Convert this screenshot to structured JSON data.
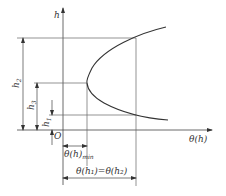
{
  "diagram": {
    "axes": {
      "y_label": "h",
      "x_label": "θ(h)",
      "origin_label": "O"
    },
    "dimensions": {
      "h2": {
        "base": "h",
        "sub": "2"
      },
      "h_min": {
        "base": "h",
        "sub": "3"
      },
      "h1": {
        "base": "h",
        "sub": "1"
      }
    },
    "annotations": {
      "theta_min": {
        "base": "θ(h)",
        "sub": "min"
      },
      "theta_equal": {
        "text": "θ(h₁)=θ(h₂)"
      }
    },
    "colors": {
      "line": "#555555",
      "curve": "#333333",
      "text": "#333333",
      "background": "#ffffff"
    }
  }
}
